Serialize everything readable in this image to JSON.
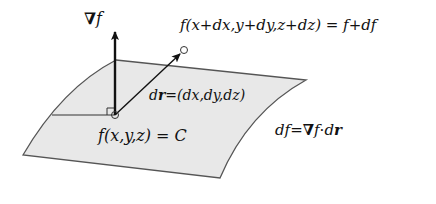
{
  "diagram": {
    "type": "gradient-level-surface",
    "colors": {
      "surface_fill": "#e8e8e8",
      "surface_edge": "#555555",
      "arrow": "#111111",
      "text": "#111111"
    },
    "labels": {
      "gradient": {
        "nabla": "∇",
        "f": "f"
      },
      "displaced_point": "f(x+dx,y+dy,z+dz) = f+df",
      "dr_def": {
        "dr_d": "d",
        "dr_r": "r",
        "rest": "=(dx,dy,dz)"
      },
      "surface_eq": "f(x,y,z) = C",
      "df_eq": {
        "df": "df",
        "eq": "=",
        "nabla": "∇",
        "f": "f",
        "dot": "·",
        "d": "d",
        "r": "r"
      }
    }
  }
}
